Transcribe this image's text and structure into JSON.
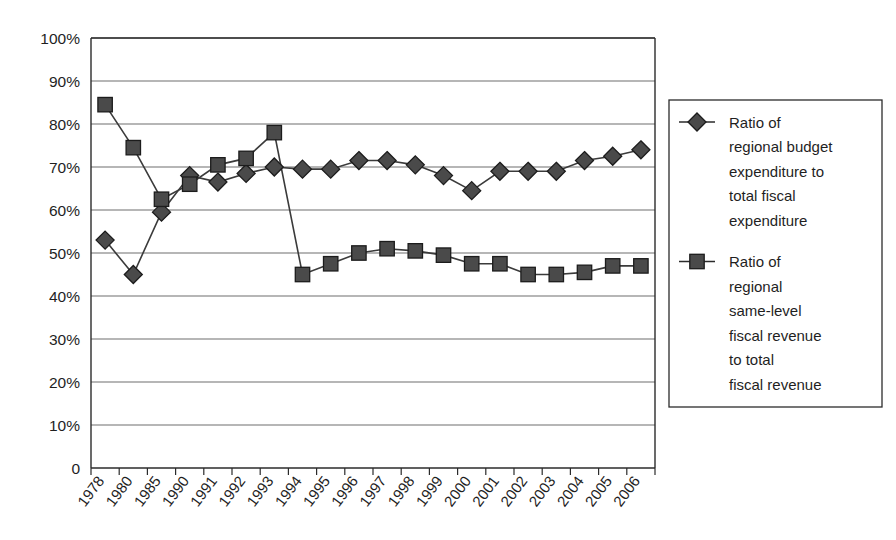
{
  "chart_data": {
    "type": "line",
    "title": "",
    "subtitle": "",
    "xlabel": "",
    "ylabel": "",
    "ylim": [
      0,
      100
    ],
    "ytick_labels": [
      "0",
      "10%",
      "20%",
      "30%",
      "40%",
      "50%",
      "60%",
      "70%",
      "80%",
      "90%",
      "100%"
    ],
    "ytick_values": [
      0,
      10,
      20,
      30,
      40,
      50,
      60,
      70,
      80,
      90,
      100
    ],
    "grid": "horizontal",
    "legend_position": "right",
    "categories": [
      "1978",
      "1980",
      "1985",
      "1990",
      "1991",
      "1992",
      "1993",
      "1994",
      "1995",
      "1996",
      "1997",
      "1998",
      "1999",
      "2000",
      "2001",
      "2002",
      "2003",
      "2004",
      "2005",
      "2006"
    ],
    "series": [
      {
        "name": "Ratio of regional budget expenditure to total fiscal expenditure",
        "marker": "diamond",
        "color": "#4a4a4a",
        "values": [
          53.0,
          45.0,
          59.5,
          68.0,
          66.5,
          68.5,
          70.0,
          69.5,
          69.5,
          71.5,
          71.5,
          70.5,
          68.0,
          64.5,
          69.0,
          69.0,
          69.0,
          71.5,
          72.5,
          74.0
        ]
      },
      {
        "name": "Ratio of regional same-level fiscal revenue to total fiscal revenue",
        "marker": "square",
        "color": "#4a4a4a",
        "values": [
          84.5,
          74.5,
          62.5,
          66.0,
          70.5,
          72.0,
          78.0,
          45.0,
          47.5,
          50.0,
          51.0,
          50.5,
          49.5,
          47.5,
          47.5,
          45.0,
          45.0,
          45.5,
          47.0,
          47.0
        ]
      }
    ]
  },
  "legend": {
    "items": [
      {
        "marker": "diamond",
        "lines": [
          "Ratio of",
          "regional budget",
          "expenditure to",
          "total fiscal",
          "expenditure"
        ]
      },
      {
        "marker": "square",
        "lines": [
          "Ratio of",
          "regional",
          "same-level",
          "fiscal revenue",
          "to total",
          "fiscal revenue"
        ]
      }
    ]
  },
  "colors": {
    "marker_fill": "#4a4a4a",
    "marker_stroke": "#1c1c1c",
    "line": "#3b3b3b",
    "gridline": "#6e6e6e",
    "axis": "#2b2b2b",
    "background": "#ffffff"
  }
}
